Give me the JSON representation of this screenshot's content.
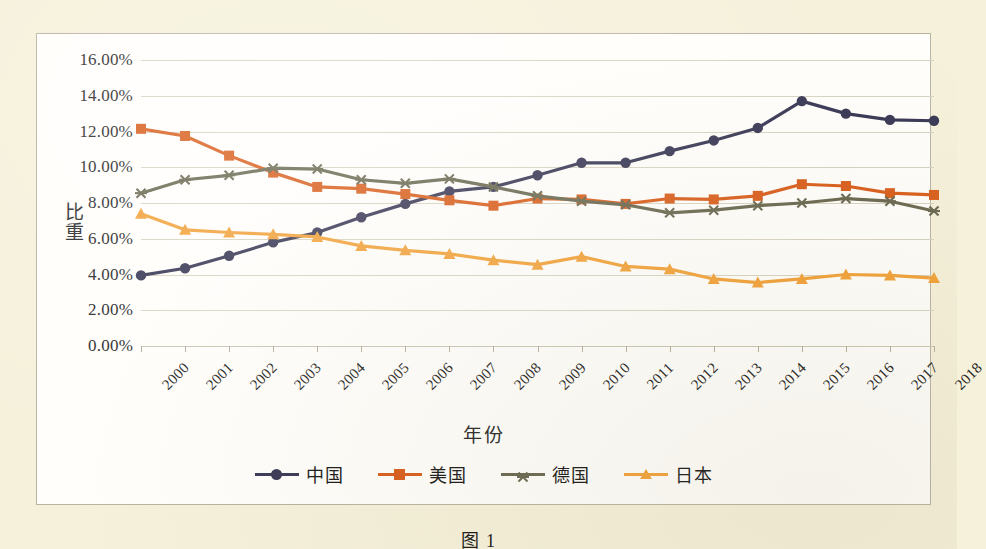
{
  "chart_data": {
    "type": "line",
    "title": "",
    "xlabel": "年份",
    "ylabel": "比重",
    "grid": true,
    "legend_position": "bottom",
    "x": [
      "2000",
      "2001",
      "2002",
      "2003",
      "2004",
      "2005",
      "2006",
      "2007",
      "2008",
      "2009",
      "2010",
      "2011",
      "2012",
      "2013",
      "2014",
      "2015",
      "2016",
      "2017",
      "2018"
    ],
    "ylim": [
      0,
      16
    ],
    "y_unit": "percent",
    "yticks": [
      "0.00%",
      "2.00%",
      "4.00%",
      "6.00%",
      "8.00%",
      "10.00%",
      "12.00%",
      "14.00%",
      "16.00%"
    ],
    "ytick_values": [
      0,
      2,
      4,
      6,
      8,
      10,
      12,
      14,
      16
    ],
    "series": [
      {
        "name": "中国",
        "color": "#3b3a57",
        "marker": "circle",
        "values": [
          3.95,
          4.35,
          5.05,
          5.8,
          6.35,
          7.2,
          7.95,
          8.65,
          8.9,
          9.55,
          10.25,
          10.25,
          10.9,
          11.5,
          12.2,
          13.7,
          13.0,
          12.65,
          12.6
        ]
      },
      {
        "name": "美国",
        "color": "#d9601f",
        "marker": "square",
        "values": [
          12.15,
          11.75,
          10.65,
          9.7,
          8.9,
          8.8,
          8.5,
          8.15,
          7.85,
          8.25,
          8.2,
          7.95,
          8.25,
          8.2,
          8.4,
          9.05,
          8.95,
          8.55,
          8.45
        ]
      },
      {
        "name": "德国",
        "color": "#6b6a52",
        "marker": "asterisk",
        "values": [
          8.55,
          9.3,
          9.55,
          9.95,
          9.9,
          9.3,
          9.1,
          9.35,
          8.9,
          8.4,
          8.1,
          7.9,
          7.45,
          7.6,
          7.85,
          8.0,
          8.25,
          8.1,
          7.55
        ]
      },
      {
        "name": "日本",
        "color": "#f2a33c",
        "marker": "triangle",
        "values": [
          7.4,
          6.5,
          6.35,
          6.25,
          6.1,
          5.6,
          5.35,
          5.15,
          4.8,
          4.55,
          5.0,
          4.45,
          4.3,
          3.75,
          3.55,
          3.75,
          4.0,
          3.95,
          3.8
        ]
      }
    ]
  },
  "legend": {
    "items": [
      {
        "label": "中国"
      },
      {
        "label": "美国"
      },
      {
        "label": "德国"
      },
      {
        "label": "日本"
      }
    ]
  },
  "axes": {
    "x_title": "年份",
    "y_title": "比重"
  },
  "caption": {
    "text": "图  1"
  }
}
